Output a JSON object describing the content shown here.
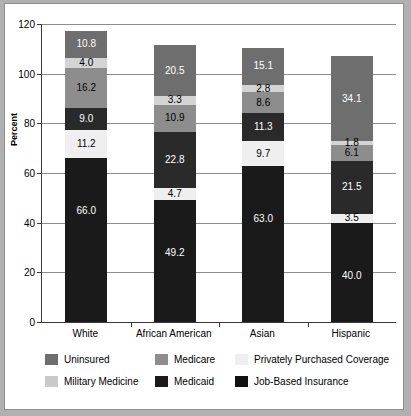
{
  "chart_data": {
    "type": "bar",
    "subtype": "stacked-bar",
    "title": "",
    "xlabel": "",
    "ylabel": "Percent",
    "ylim": [
      0,
      120
    ],
    "yticks": [
      0,
      20,
      40,
      60,
      80,
      100,
      120
    ],
    "ytick_labels": [
      "0",
      "20",
      "40",
      "60",
      "80",
      "100",
      "120"
    ],
    "grid": true,
    "legend_position": "bottom",
    "categories": [
      "White",
      "African American",
      "Asian",
      "Hispanic"
    ],
    "stack_order_bottom_to_top": [
      "Job-Based Insurance",
      "Privately Purchased Coverage",
      "Medicaid",
      "Medicare",
      "Military Medicine",
      "Uninsured"
    ],
    "series": [
      {
        "name": "Job-Based Insurance",
        "color": "#1a1a1a",
        "values": [
          66.0,
          49.2,
          63.0,
          40.0
        ]
      },
      {
        "name": "Privately Purchased Coverage",
        "color": "#efefef",
        "values": [
          11.2,
          4.7,
          9.7,
          3.5
        ]
      },
      {
        "name": "Medicaid",
        "color": "#2a2a2a",
        "values": [
          9.0,
          22.8,
          11.3,
          21.5
        ]
      },
      {
        "name": "Medicare",
        "color": "#8d8d8d",
        "values": [
          16.2,
          10.9,
          8.6,
          6.1
        ]
      },
      {
        "name": "Military Medicine",
        "color": "#d4d4d4",
        "values": [
          4.0,
          3.3,
          2.8,
          1.8
        ]
      },
      {
        "name": "Uninsured",
        "color": "#6e6e6e",
        "values": [
          10.8,
          20.5,
          15.1,
          34.1
        ]
      }
    ],
    "bar_totals": [
      117.2,
      111.4,
      110.5,
      107.0
    ],
    "data_labels": {
      "White": [
        "66.0",
        "11.2",
        "9.0",
        "16.2",
        "4.0",
        "10.8"
      ],
      "African American": [
        "49.2",
        "4.7",
        "22.8",
        "10.9",
        "3.3",
        "20.5"
      ],
      "Asian": [
        "63.0",
        "9.7",
        "11.3",
        "8.6",
        "2.8",
        "15.1"
      ],
      "Hispanic": [
        "40.0",
        "3.5",
        "21.5",
        "6.1",
        "1.8",
        "34.1"
      ]
    }
  },
  "legend": {
    "row1": [
      {
        "label": "Uninsured",
        "swatch": "s-uninsured"
      },
      {
        "label": "Medicare",
        "swatch": "s-medicare"
      },
      {
        "label": "Privately Purchased Coverage",
        "swatch": "s-private"
      }
    ],
    "row2": [
      {
        "label": "Military Medicine",
        "swatch": "s-military"
      },
      {
        "label": "Medicaid",
        "swatch": "s-medicaid"
      },
      {
        "label": "Job-Based Insurance",
        "swatch": "s-job"
      }
    ]
  }
}
